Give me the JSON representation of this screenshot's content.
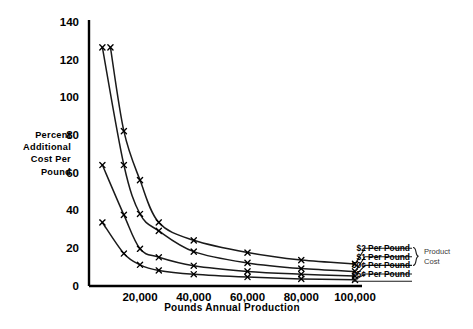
{
  "chart_data": {
    "type": "line",
    "title": "",
    "subtitle": "",
    "xlabel": "Pounds Annual Production",
    "ylabel": "Percent Additional Cost Per Pound",
    "ylabel_lines": [
      "Percent",
      "Additional",
      "Cost Per",
      "Pound"
    ],
    "xlim": [
      0,
      110000
    ],
    "ylim": [
      0,
      140
    ],
    "grid": false,
    "legend_position": "right",
    "legend_group_label_lines": [
      "Product",
      "Cost"
    ],
    "legend_group_label": "Product Cost",
    "yticks": [
      0,
      20,
      40,
      60,
      80,
      100,
      120,
      140
    ],
    "ytick_labels": [
      "0",
      "20",
      "40",
      "60",
      "80",
      "100",
      "120",
      "140"
    ],
    "xticks": [
      20000,
      40000,
      60000,
      80000,
      100000
    ],
    "xtick_labels": [
      "20,000",
      "40,000",
      "60,000",
      "80,000",
      "100,000"
    ],
    "marker": "x",
    "x": [
      6000,
      9000,
      14000,
      20000,
      27000,
      40000,
      60000,
      80000,
      100000
    ],
    "series": [
      {
        "name": "$2 Per Pound",
        "legend_label": "$2 Per Pound",
        "x": [
          9000,
          14000,
          20000,
          27000,
          40000,
          60000,
          80000,
          100000
        ],
        "values": [
          126.5,
          82.0,
          56.0,
          33.5,
          24.0,
          17.5,
          13.5,
          11.5
        ]
      },
      {
        "name": "$1 Per Pound",
        "legend_label": "$1 Per Pound",
        "x": [
          6000,
          14000,
          20000,
          27000,
          40000,
          60000,
          80000,
          100000
        ],
        "values": [
          126.5,
          64.0,
          38.0,
          29.0,
          18.0,
          12.0,
          9.0,
          7.5
        ]
      },
      {
        "name": "50¢ Per Pound",
        "legend_label": "50¢ Per Pound",
        "x": [
          6000,
          14000,
          20000,
          27000,
          40000,
          60000,
          80000,
          100000
        ],
        "values": [
          64.0,
          37.5,
          19.5,
          15.0,
          10.5,
          7.5,
          6.0,
          5.0
        ]
      },
      {
        "name": "25¢ Per Pound",
        "legend_label": "25¢ Per Pound",
        "x": [
          6000,
          14000,
          20000,
          27000,
          40000,
          60000,
          80000,
          100000
        ],
        "values": [
          33.5,
          17.0,
          11.0,
          8.0,
          6.0,
          4.5,
          3.5,
          3.0
        ]
      }
    ],
    "colors": {
      "axis": "#000000",
      "curve": "#1a1a1a",
      "background": "#ffffff",
      "brace_label": "#3a3a3a"
    }
  }
}
